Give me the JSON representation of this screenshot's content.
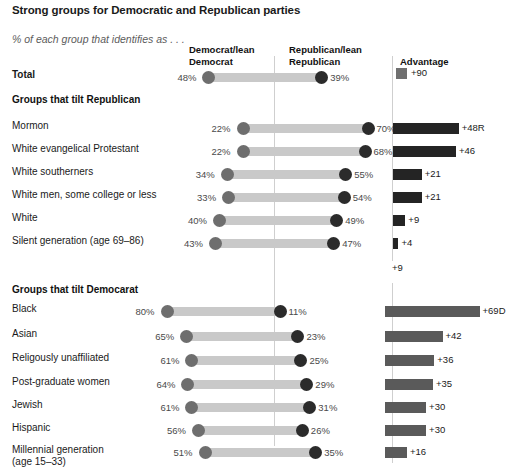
{
  "header": {
    "title": "Strong groups for Democratic\nand Republican parties",
    "subtitle": "% of each group that identifies as . . ."
  },
  "columns": {
    "democrat": "Democrat/lean\nDemocrat",
    "republican": "Republican/lean\nRepublican",
    "advantage": "Advantage"
  },
  "legend": {
    "total_advantage_label": "+90"
  },
  "sections": {
    "republican_tilt": "Groups that tilt Republican",
    "democrat_tilt": "Groups that tilt Democarat"
  },
  "stray_label": "+9",
  "colors": {
    "connector": "#c9c9c9",
    "dem_dot": "#6e6e6e",
    "rep_dot": "#2b2b2b",
    "adv_bar_republican": "#242424",
    "adv_bar_democrat": "#5a5a5a",
    "rule": "#cfcfcf"
  },
  "chart_data": {
    "type": "bar",
    "title": "Strong groups for Democratic and Republican parties",
    "subtitle": "% of each group that identifies as . . .",
    "xlabel": "",
    "ylabel": "",
    "grid": false,
    "legend_position": "top",
    "series": [
      {
        "name": "Democrat/lean Democrat",
        "key": "dem"
      },
      {
        "name": "Republican/lean Republican",
        "key": "rep"
      },
      {
        "name": "Advantage",
        "key": "advantage"
      }
    ],
    "total_row": {
      "label": "Total",
      "dem": 48,
      "rep": 39,
      "dem_label": "48%",
      "rep_label": "39%",
      "advantage_label": "+90",
      "advantage": 90
    },
    "groups": [
      {
        "section": "Groups that tilt Republican",
        "tilt": "R",
        "rows": [
          {
            "label": "Mormon",
            "dem": 22,
            "rep": 70,
            "dem_label": "22%",
            "rep_label": "70%",
            "advantage": 48,
            "advantage_label": "+48R"
          },
          {
            "label": "White evangelical Protestant",
            "dem": 22,
            "rep": 68,
            "dem_label": "22%",
            "rep_label": "68%",
            "advantage": 46,
            "advantage_label": "+46"
          },
          {
            "label": "White southerners",
            "dem": 34,
            "rep": 55,
            "dem_label": "34%",
            "rep_label": "55%",
            "advantage": 21,
            "advantage_label": "+21"
          },
          {
            "label": "White men, some college or less",
            "dem": 33,
            "rep": 54,
            "dem_label": "33%",
            "rep_label": "54%",
            "advantage": 21,
            "advantage_label": "+21"
          },
          {
            "label": "White",
            "dem": 40,
            "rep": 49,
            "dem_label": "40%",
            "rep_label": "49%",
            "advantage": 9,
            "advantage_label": "+9"
          },
          {
            "label": "Silent generation (age 69–86)",
            "dem": 43,
            "rep": 47,
            "dem_label": "43%",
            "rep_label": "47%",
            "advantage": 4,
            "advantage_label": "+4"
          }
        ]
      },
      {
        "section": "Groups that tilt Democarat",
        "tilt": "D",
        "rows": [
          {
            "label": "Black",
            "dem": 80,
            "rep": 11,
            "dem_label": "80%",
            "rep_label": "11%",
            "advantage": 69,
            "advantage_label": "+69D"
          },
          {
            "label": "Asian",
            "dem": 65,
            "rep": 23,
            "dem_label": "65%",
            "rep_label": "23%",
            "advantage": 42,
            "advantage_label": "+42"
          },
          {
            "label": "Religously unaffiliated",
            "dem": 61,
            "rep": 25,
            "dem_label": "61%",
            "rep_label": "25%",
            "advantage": 36,
            "advantage_label": "+36"
          },
          {
            "label": "Post-graduate women",
            "dem": 64,
            "rep": 29,
            "dem_label": "64%",
            "rep_label": "29%",
            "advantage": 35,
            "advantage_label": "+35"
          },
          {
            "label": "Jewish",
            "dem": 61,
            "rep": 31,
            "dem_label": "61%",
            "rep_label": "31%",
            "advantage": 30,
            "advantage_label": "+30"
          },
          {
            "label": "Hispanic",
            "dem": 56,
            "rep": 26,
            "dem_label": "56%",
            "rep_label": "26%",
            "advantage": 30,
            "advantage_label": "+30"
          },
          {
            "label": "Millennial generation\n(age 15–33)",
            "dem": 51,
            "rep": 35,
            "dem_label": "51%",
            "rep_label": "35%",
            "advantage": 16,
            "advantage_label": "+16"
          }
        ]
      }
    ]
  }
}
